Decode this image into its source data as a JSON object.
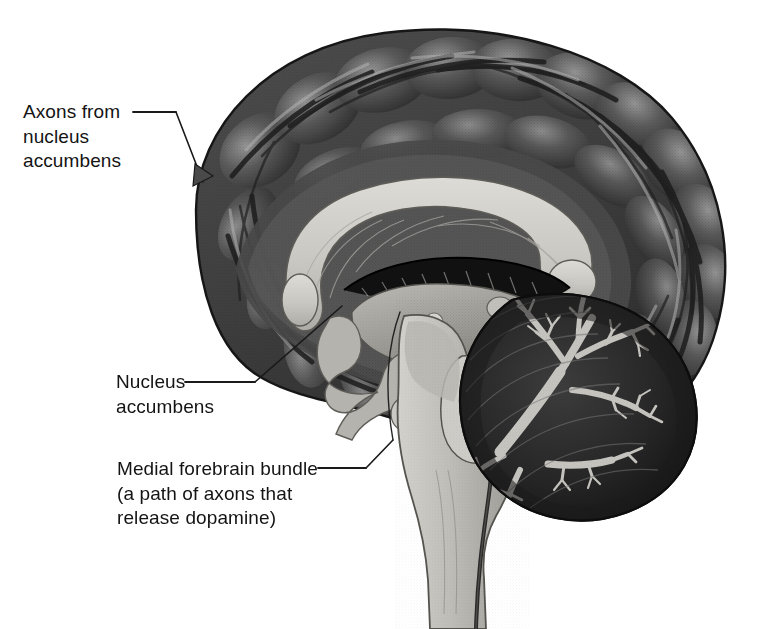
{
  "figure": {
    "background_color": "#ffffff",
    "width": 784,
    "height": 629
  },
  "labels": [
    {
      "id": "axons-from-nucleus-accumbens",
      "text": "Axons from\nnucleus\naccumbens",
      "lines": [
        "Axons from",
        "nucleus",
        "accumbens"
      ],
      "leader": "line-with-arrowhead",
      "points_to": "frontal-cortex"
    },
    {
      "id": "nucleus-accumbens",
      "text": "Nucleus\naccumbens",
      "lines": [
        "Nucleus",
        "accumbens"
      ],
      "leader": "line",
      "points_to": "nucleus-accumbens-region"
    },
    {
      "id": "medial-forebrain-bundle",
      "text": "Medial forebrain bundle\n(a path of axons that\nrelease dopamine)",
      "lines": [
        "Medial forebrain bundle",
        "(a path of axons that",
        "release dopamine)"
      ],
      "leader": "line",
      "points_to": "medial-forebrain-bundle-tract"
    }
  ],
  "structures": [
    {
      "id": "cerebral-cortex",
      "name": "Cerebral cortex (gyri and sulci)",
      "tone": "dark-gray"
    },
    {
      "id": "corpus-callosum",
      "name": "Corpus callosum",
      "tone": "light-gray"
    },
    {
      "id": "fornix",
      "name": "Fornix / choroid plexus",
      "tone": "black"
    },
    {
      "id": "thalamus",
      "name": "Thalamus",
      "tone": "mid-gray"
    },
    {
      "id": "midbrain",
      "name": "Midbrain",
      "tone": "light-gray"
    },
    {
      "id": "pons",
      "name": "Pons",
      "tone": "light-gray"
    },
    {
      "id": "medulla",
      "name": "Medulla / spinal cord",
      "tone": "light-gray"
    },
    {
      "id": "cerebellum",
      "name": "Cerebellum with arbor vitae",
      "tone": "dark-gray"
    }
  ],
  "colors": {
    "background": "#ffffff",
    "cortex_dark": "#3a3a3a",
    "cortex_mid": "#565656",
    "cortex_light": "#8e8e8e",
    "white_matter": "#c9c7c2",
    "white_matter_light": "#d8d6d1",
    "brainstem": "#bdbbb6",
    "cerebellum_dark": "#2b2b2b",
    "arbor_vitae": "#c6c4bf",
    "fornix_black": "#121212",
    "leader_line": "#1a1a1a",
    "text": "#141414"
  }
}
